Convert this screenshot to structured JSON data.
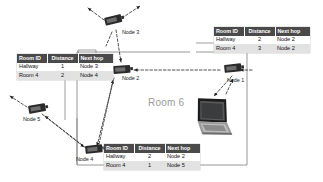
{
  "diagram": {
    "room_label": "Room 6",
    "columns": [
      "Room ID",
      "Distance",
      "Next hop"
    ],
    "tables": [
      {
        "id": "table-left",
        "name": "routing-table-node-2",
        "rows": [
          {
            "room_id": "Hallway",
            "distance": "1",
            "next_hop": "Node 3"
          },
          {
            "room_id": "Room 4",
            "distance": "2",
            "next_hop": "Node 4"
          }
        ]
      },
      {
        "id": "table-right",
        "name": "routing-table-node-1",
        "rows": [
          {
            "room_id": "Hallway",
            "distance": "2",
            "next_hop": "Node 2"
          },
          {
            "room_id": "Room 4",
            "distance": "3",
            "next_hop": "Node 2"
          }
        ]
      },
      {
        "id": "table-bottom",
        "name": "routing-table-node-4",
        "rows": [
          {
            "room_id": "Hallway",
            "distance": "2",
            "next_hop": "Node 2"
          },
          {
            "room_id": "Room 4",
            "distance": "1",
            "next_hop": "Node 5"
          }
        ]
      }
    ],
    "nodes": [
      {
        "id": "node-3",
        "label": "Node 3",
        "label_x": 122,
        "label_y": 29,
        "icon_x": 104,
        "icon_y": 18,
        "rotation": -14
      },
      {
        "id": "node-2",
        "label": "Node 2",
        "label_x": 122,
        "label_y": 76,
        "icon_x": 113,
        "icon_y": 66,
        "rotation": -4
      },
      {
        "id": "node-1",
        "label": "Node 1",
        "label_x": 228,
        "label_y": 77,
        "icon_x": 224,
        "icon_y": 65,
        "rotation": -6
      },
      {
        "id": "node-5",
        "label": "Node 5",
        "label_x": 24,
        "label_y": 117,
        "icon_x": 28,
        "icon_y": 106,
        "rotation": -10
      },
      {
        "id": "node-4",
        "label": "Node 4",
        "label_x": 77,
        "label_y": 157,
        "icon_x": 85,
        "icon_y": 146,
        "rotation": -6
      }
    ],
    "laptop": {
      "name": "laptop-device",
      "x": 200,
      "y": 100
    },
    "colors": {
      "header_bg": "#4a4a4a",
      "header_text": "#ffffff",
      "row_alt_bg": "#e2e2e2",
      "room_outline": "#8a8a8a",
      "room_text": "#9b9b9b",
      "link_line": "#3a3a3a",
      "device_body": "#2b2b2b"
    }
  }
}
